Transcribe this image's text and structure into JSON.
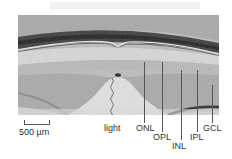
{
  "figure": {
    "scale_bar": {
      "label": "500 µm"
    },
    "annotations": [
      {
        "id": "light",
        "label": "light"
      },
      {
        "id": "onl",
        "label": "ONL"
      },
      {
        "id": "opl",
        "label": "OPL"
      },
      {
        "id": "inl",
        "label": "INL"
      },
      {
        "id": "ipl",
        "label": "IPL"
      },
      {
        "id": "gcl",
        "label": "GCL"
      }
    ],
    "colors": {
      "background": "#ffffff",
      "tissue_light": "#cfcfcf",
      "tissue_dark": "#3a3a3a",
      "label_text": "#333333",
      "leader_line": "#555555"
    }
  }
}
